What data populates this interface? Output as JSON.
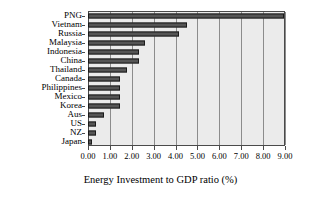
{
  "chart_data": {
    "type": "bar",
    "orientation": "horizontal",
    "title": "",
    "xlabel": "Energy Investment to GDP ratio (%)",
    "ylabel": "",
    "xlim": [
      0.0,
      9.0
    ],
    "xtick_labels": [
      "0.00",
      "1.00",
      "2.00",
      "3.00",
      "4.00",
      "5.00",
      "6.00",
      "7.00",
      "8.00",
      "9.00"
    ],
    "xtick_values": [
      0,
      1,
      2,
      3,
      4,
      5,
      6,
      7,
      8,
      9
    ],
    "grid": true,
    "legend": false,
    "bar_color": "#555555",
    "bar_edge_color": "#1a1a1a",
    "plot_background": "#ebebeb",
    "categories": [
      "PNG",
      "Vietnam",
      "Russia",
      "Malaysia",
      "Indonesia",
      "China",
      "Thailand",
      "Canada",
      "Philippines",
      "Mexico",
      "Korea",
      "Aus",
      "US",
      "NZ",
      "Japan"
    ],
    "values": [
      8.95,
      4.5,
      4.15,
      2.6,
      2.35,
      2.35,
      1.8,
      1.45,
      1.45,
      1.45,
      1.45,
      0.75,
      0.37,
      0.37,
      0.2
    ]
  }
}
